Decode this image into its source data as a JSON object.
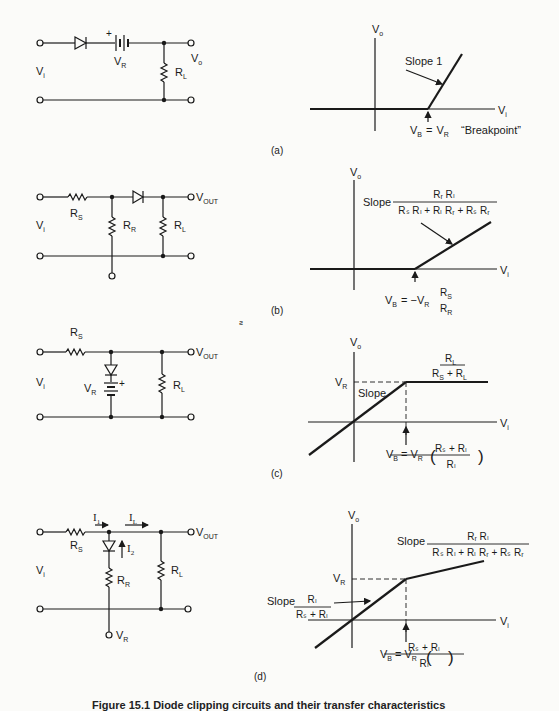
{
  "figure": {
    "caption": "Figure 15.1  Diode clipping circuits and their transfer characteristics",
    "stray_mark": "ƨ",
    "panels": [
      {
        "id": "a",
        "label": "(a)",
        "circuit": {
          "input_label": "V",
          "input_sub": "i",
          "output_label": "V",
          "output_sub": "o",
          "battery_label": "V",
          "battery_sub": "R",
          "battery_polarity": "+",
          "load_label": "R",
          "load_sub": "L"
        },
        "graph": {
          "y_axis": "V",
          "y_axis_sub": "o",
          "x_axis": "V",
          "x_axis_sub": "i",
          "slope_label": "Slope 1",
          "breakpoint_lhs": "V",
          "breakpoint_lhs_sub": "B",
          "breakpoint_eq": "=",
          "breakpoint_rhs": "V",
          "breakpoint_rhs_sub": "R",
          "breakpoint_note": "“Breakpoint”"
        }
      },
      {
        "id": "b",
        "label": "(b)",
        "circuit": {
          "input_label": "V",
          "input_sub": "i",
          "output_label": "V",
          "output_sub": "OUT",
          "series_label": "R",
          "series_sub": "S",
          "shunt_label": "R",
          "shunt_sub": "R",
          "load_label": "R",
          "load_sub": "L"
        },
        "graph": {
          "y_axis": "V",
          "y_axis_sub": "o",
          "x_axis": "V",
          "x_axis_sub": "i",
          "slope_word": "Slope",
          "slope_num": "Rᵣ Rₗ",
          "slope_den": "Rₛ Rₗ + Rₗ Rᵣ + Rₛ Rᵣ",
          "breakpoint_lhs": "V",
          "breakpoint_lhs_sub": "B",
          "breakpoint_mid": "= −V",
          "breakpoint_mid_sub": "R",
          "breakpoint_frac_num": "R",
          "breakpoint_frac_num_sub": "S",
          "breakpoint_frac_den": "R",
          "breakpoint_frac_den_sub": "R"
        }
      },
      {
        "id": "c",
        "label": "(c)",
        "circuit": {
          "input_label": "V",
          "input_sub": "i",
          "output_label": "V",
          "output_sub": "OUT",
          "series_label": "R",
          "series_sub": "S",
          "battery_label": "V",
          "battery_sub": "R",
          "battery_polarity": "+",
          "load_label": "R",
          "load_sub": "L"
        },
        "graph": {
          "y_axis": "V",
          "y_axis_sub": "o",
          "x_axis": "V",
          "x_axis_sub": "i",
          "level_label": "V",
          "level_sub": "R",
          "slope_word": "Slope",
          "slope_num": "R",
          "slope_num_sub": "L",
          "slope_den_a": "R",
          "slope_den_a_sub": "S",
          "slope_den_plus": "+",
          "slope_den_b": "R",
          "slope_den_b_sub": "L",
          "breakpoint_lhs": "V",
          "breakpoint_lhs_sub": "B",
          "breakpoint_mid": "= V",
          "breakpoint_mid_sub": "R",
          "breakpoint_frac_num": "Rₛ + Rₗ",
          "breakpoint_frac_den": "Rₗ"
        }
      },
      {
        "id": "d",
        "label": "(d)",
        "circuit": {
          "input_label": "V",
          "input_sub": "i",
          "output_label": "V",
          "output_sub": "OUT",
          "series_label": "R",
          "series_sub": "S",
          "shunt_label": "R",
          "shunt_sub": "R",
          "load_label": "R",
          "load_sub": "L",
          "ref_label": "V",
          "ref_sub": "R",
          "current_1": "I",
          "current_1_sub": "1",
          "current_2": "I",
          "current_2_sub": "2",
          "current_L": "I",
          "current_L_sub": "L"
        },
        "graph": {
          "y_axis": "V",
          "y_axis_sub": "o",
          "x_axis": "V",
          "x_axis_sub": "i",
          "level_label": "V",
          "level_sub": "R",
          "slope1_word": "Slope",
          "slope1_num": "Rₗ",
          "slope1_den": "Rₛ + Rₗ",
          "slope2_word": "Slope",
          "slope2_num": "Rᵣ Rₗ",
          "slope2_den": "Rₛ Rₗ + Rₗ Rᵣ + Rₛ Rᵣ",
          "breakpoint_lhs": "V",
          "breakpoint_lhs_sub": "B",
          "breakpoint_mid": "= V",
          "breakpoint_mid_sub": "R",
          "breakpoint_frac_num": "Rₛ + Rₗ",
          "breakpoint_frac_den": "Rₗ"
        }
      }
    ]
  }
}
